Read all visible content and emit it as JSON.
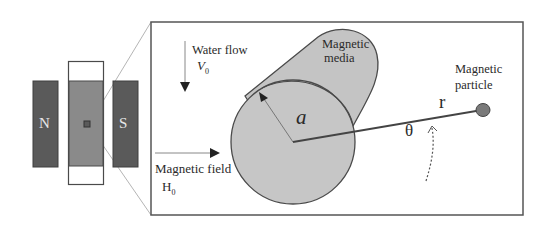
{
  "diagram": {
    "type": "magnetic-separation-schematic",
    "magnet": {
      "north_label": "N",
      "south_label": "S"
    },
    "labels": {
      "water_flow": "Water flow",
      "flow_velocity": "V",
      "flow_velocity_sub": "0",
      "magnetic_media_line1": "Magnetic",
      "magnetic_media_line2": "media",
      "radius_symbol": "a",
      "magnetic_particle_line1": "Magnetic",
      "magnetic_particle_line2": "particle",
      "distance_symbol": "r",
      "angle_symbol": "θ",
      "magnetic_field": "Magnetic field",
      "field_symbol": "H",
      "field_symbol_sub": "0"
    },
    "colors": {
      "magnet_fill": "#5a5a5a",
      "column_fill": "#8a8a8a",
      "media_fill": "#c4c4c4",
      "outline": "#4a4a4a",
      "particle_fill": "#7a7a7a",
      "background": "#ffffff"
    }
  }
}
